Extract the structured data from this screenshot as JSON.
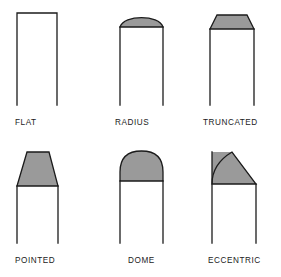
{
  "figure": {
    "background_color": "#ffffff",
    "outline_color": "#1b1b1b",
    "fill_color": "#9a9a9a",
    "stroke_width": 1.3
  },
  "shapes": [
    {
      "id": "flat",
      "label": "FLAT",
      "nose_type": "flat",
      "nose_filled": false,
      "body": {
        "left": 17,
        "right": 57,
        "top": 13,
        "bottom": 105
      },
      "nose_top": 13
    },
    {
      "id": "radius",
      "label": "RADIUS",
      "nose_type": "shallow-arc",
      "nose_filled": true,
      "body": {
        "left": 120,
        "right": 163,
        "top": 27,
        "bottom": 105
      },
      "nose_top": 13
    },
    {
      "id": "truncated",
      "label": "TRUNCATED",
      "nose_type": "short-trapezoid",
      "nose_filled": true,
      "body": {
        "left": 210,
        "right": 254,
        "top": 29,
        "bottom": 105
      },
      "nose_top": 15,
      "nose_top_left": 217,
      "nose_top_right": 247
    },
    {
      "id": "pointed",
      "label": "POINTED",
      "nose_type": "tall-trapezoid",
      "nose_filled": true,
      "body": {
        "left": 17,
        "right": 58,
        "top": 186,
        "bottom": 243
      },
      "nose_top": 152,
      "nose_top_left": 27,
      "nose_top_right": 49
    },
    {
      "id": "dome",
      "label": "DOME",
      "nose_type": "dome",
      "nose_filled": true,
      "body": {
        "left": 120,
        "right": 163,
        "top": 181,
        "bottom": 243
      },
      "nose_top": 151
    },
    {
      "id": "eccentric",
      "label": "ECCENTRIC",
      "nose_type": "eccentric-curve",
      "nose_filled": true,
      "body": {
        "left": 212,
        "right": 256,
        "top": 184,
        "bottom": 243
      },
      "nose_top": 152,
      "nose_top_right": 232
    }
  ]
}
